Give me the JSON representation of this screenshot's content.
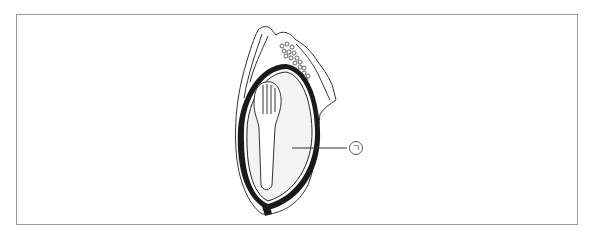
{
  "figure": {
    "labels": [
      {
        "id": "label-a",
        "text": "ㄱ",
        "points_to": "endosperm"
      }
    ]
  },
  "colors": {
    "border": "#9a9a9a",
    "ink": "#1a1a1a",
    "endosperm_fill": "#f3f3f3"
  }
}
